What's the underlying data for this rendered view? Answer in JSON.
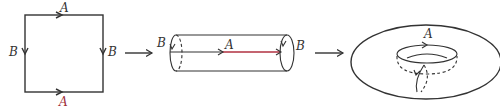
{
  "diagram": {
    "stages": [
      {
        "name": "square",
        "labels": {
          "top": "A",
          "bottom": "A",
          "left": "B",
          "right": "B"
        }
      },
      {
        "name": "cylinder",
        "labels": {
          "left": "B",
          "middle": "A",
          "right": "B"
        }
      },
      {
        "name": "torus",
        "labels": {
          "top": "A"
        }
      }
    ],
    "arrows": [
      "→",
      "→"
    ],
    "colors": {
      "line": "#333333",
      "accent_red": "#b03040",
      "background": "#ffffff"
    }
  }
}
